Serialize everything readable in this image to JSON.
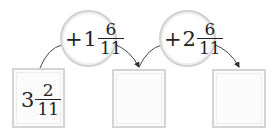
{
  "diagram": {
    "start_box": {
      "whole": "3",
      "numerator": "2",
      "denominator": "11"
    },
    "operations": [
      {
        "operator": "+",
        "whole": "1",
        "numerator": "6",
        "denominator": "11"
      },
      {
        "operator": "+",
        "whole": "2",
        "numerator": "6",
        "denominator": "11"
      }
    ],
    "result_boxes": [
      {
        "value": ""
      },
      {
        "value": ""
      }
    ],
    "colors": {
      "box_border": "#d4d4d4",
      "circle_border": "#d0d0d0",
      "arrow": "#333333",
      "text": "#222222"
    }
  }
}
